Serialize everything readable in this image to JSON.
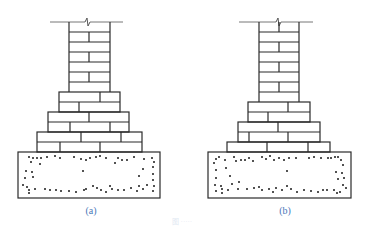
{
  "figures": [
    {
      "id": "a",
      "label": "(a)",
      "description": "Stepped brick footing with two courses per step on concrete base",
      "column_courses": 6,
      "steps": 3,
      "courses_per_step": [
        2,
        2,
        2
      ]
    },
    {
      "id": "b",
      "label": "(b)",
      "description": "Stepped brick footing with alternating step courses on concrete base",
      "column_courses": 7,
      "steps": 3,
      "courses_per_step": [
        2,
        2,
        2
      ]
    }
  ],
  "caption": "图 ·····",
  "colors": {
    "line": "#2a2a2a",
    "label": "#4a78b8",
    "ground_line": "#777777"
  }
}
